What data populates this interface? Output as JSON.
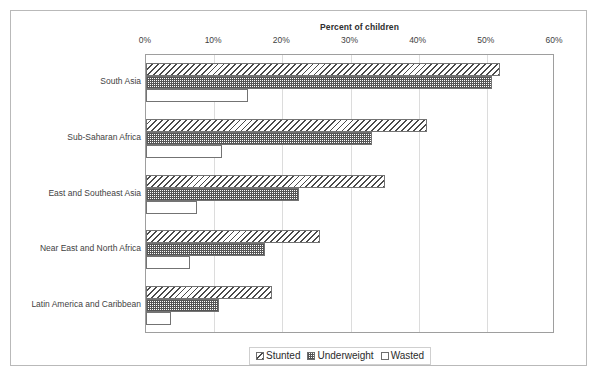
{
  "chart_data": {
    "type": "bar",
    "orientation": "horizontal",
    "title": "Percent of children",
    "xlabel": "Percent of children",
    "ylabel": "",
    "xlim": [
      0,
      60
    ],
    "xticks": [
      "0%",
      "10%",
      "20%",
      "30%",
      "40%",
      "50%",
      "60%"
    ],
    "xtick_values": [
      0,
      10,
      20,
      30,
      40,
      50,
      60
    ],
    "grid": true,
    "axis_position": "top",
    "legend_position": "bottom-center",
    "categories": [
      "South Asia",
      "Sub-Saharan Africa",
      "East and Southeast Asia",
      "Near East and North Africa",
      "Latin America and Caribbean"
    ],
    "series": [
      {
        "name": "Stunted",
        "pattern": "diagonal-hatch",
        "values": [
          52.0,
          41.2,
          35.0,
          25.5,
          18.5
        ]
      },
      {
        "name": "Underweight",
        "pattern": "cross-hatch",
        "values": [
          50.8,
          33.2,
          22.5,
          17.5,
          10.7
        ]
      },
      {
        "name": "Wasted",
        "pattern": "dotted",
        "values": [
          15.0,
          11.2,
          7.5,
          6.4,
          3.6
        ]
      }
    ]
  },
  "legend": {
    "items": [
      {
        "label": "Stunted"
      },
      {
        "label": "Underweight"
      },
      {
        "label": "Wasted"
      }
    ]
  },
  "colors": {
    "frame": "#b9b9b9",
    "plot_border": "#9e9e9e",
    "gridline": "#dcdcdc",
    "bar_outline": "#737373",
    "text": "#3f3f3f"
  }
}
